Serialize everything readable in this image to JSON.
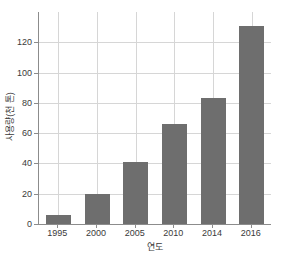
{
  "chart_data": {
    "type": "bar",
    "title": "",
    "xlabel": "연도",
    "ylabel": "사용량(천 톤)",
    "categories": [
      "1995",
      "2000",
      "2005",
      "2010",
      "2014",
      "2016"
    ],
    "values": [
      6,
      20,
      41,
      66,
      83,
      131
    ],
    "ylim": [
      0,
      140
    ],
    "yticks": [
      0,
      20,
      40,
      60,
      80,
      100,
      120
    ],
    "ytick_labels": [
      "0",
      "20",
      "40",
      "60",
      "80",
      "100",
      "120"
    ],
    "grid": "both",
    "legend": "none",
    "bar_color": "#6e6e6e",
    "axis_color": "#8c8c8c",
    "grid_color": "#d6d6d6",
    "background_color": "#ffffff",
    "text_color": "#3a3a3a",
    "series": [
      {
        "name": "사용량(천 톤)",
        "values": [
          6,
          20,
          41,
          66,
          83,
          131
        ]
      }
    ]
  }
}
